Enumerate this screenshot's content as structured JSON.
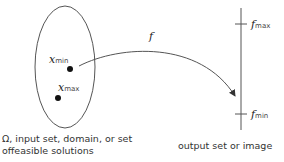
{
  "diagram": {
    "domain_set": {
      "caption_line1": "Ω, input set, domain, or set",
      "caption_line2": "offeasible solutions",
      "points": [
        {
          "var": "x",
          "sub": "min"
        },
        {
          "var": "x",
          "sub": "max"
        }
      ]
    },
    "mapping": {
      "label": "f"
    },
    "output_set": {
      "caption": "output set or image",
      "ticks": [
        {
          "var": "f",
          "sub": "max"
        },
        {
          "var": "f",
          "sub": "min"
        }
      ]
    },
    "colors": {
      "stroke": "#555555",
      "point": "#111111"
    }
  }
}
